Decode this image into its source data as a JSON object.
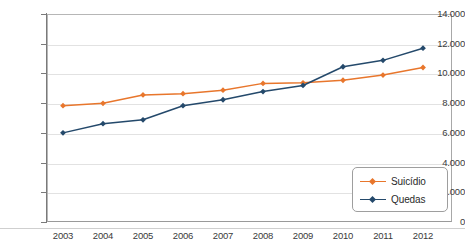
{
  "chart_data": {
    "type": "line",
    "title": "",
    "subtitle": "",
    "xlabel": "",
    "ylabel": "",
    "categories": [
      "2003",
      "2004",
      "2005",
      "2006",
      "2007",
      "2008",
      "2009",
      "2010",
      "2011",
      "2012"
    ],
    "series": [
      {
        "name": "Suicídio",
        "color": "#E8762C",
        "values": [
          7830,
          7990,
          8550,
          8640,
          8870,
          9330,
          9370,
          9540,
          9890,
          10400
        ]
      },
      {
        "name": "Quedas",
        "color": "#24496B",
        "values": [
          6000,
          6620,
          6880,
          7830,
          8230,
          8780,
          9190,
          10450,
          10880,
          11700
        ]
      }
    ],
    "ylim": [
      0,
      14000
    ],
    "ytick_values": [
      0,
      2000,
      4000,
      6000,
      8000,
      10000,
      12000,
      14000
    ],
    "ytick_labels": [
      "0",
      "2.000",
      "4.000",
      "6.000",
      "8.000",
      "10.000",
      "12.000",
      "14.000"
    ],
    "grid": true,
    "grid_axis": "y",
    "legend_position": "bottom-right",
    "marker": "diamond",
    "background_color": "#FFFFFF",
    "grid_color": "#E2E2E2",
    "axis_color": "#7A7A7A",
    "plot_border_color": "#B6B6B6"
  },
  "caption": {
    "cutoff_text": " "
  }
}
